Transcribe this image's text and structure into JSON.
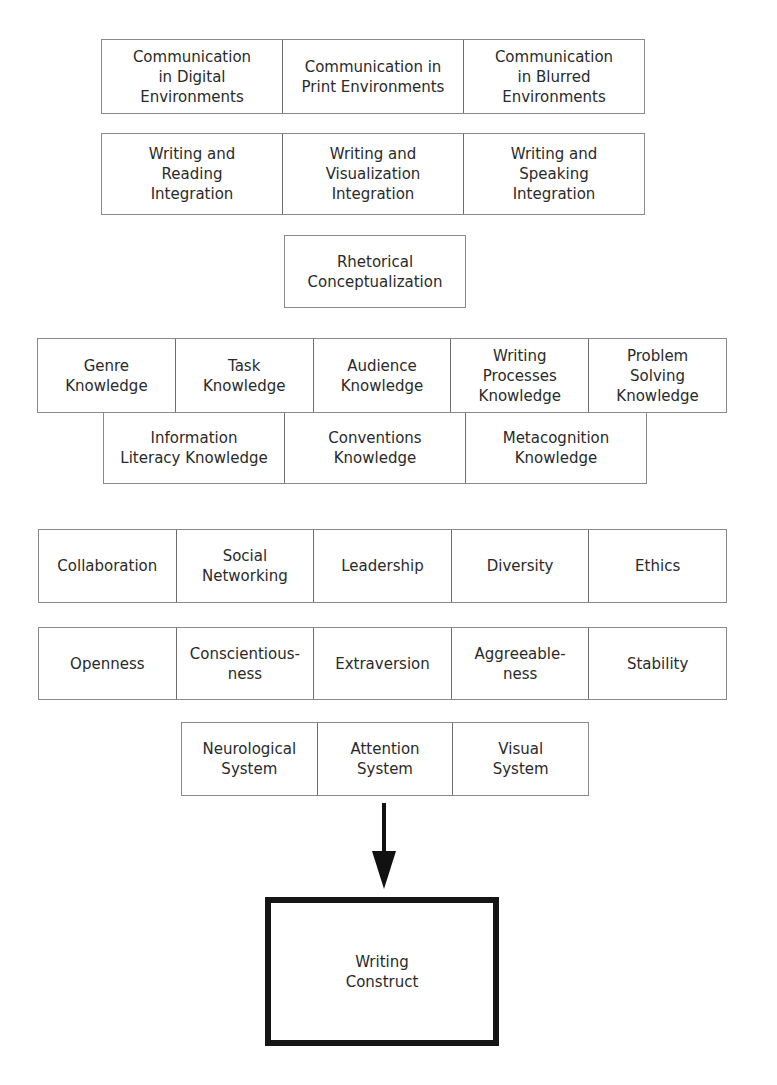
{
  "communication_environments": [
    "Communication\nin Digital\nEnvironments",
    "Communication in\nPrint Environments",
    "Communication\nin Blurred\nEnvironments"
  ],
  "integrations": [
    "Writing and\nReading\nIntegration",
    "Writing and\nVisualization\nIntegration",
    "Writing and\nSpeaking\nIntegration"
  ],
  "rhetorical": "Rhetorical\nConceptualization",
  "knowledge_row_1": [
    "Genre\nKnowledge",
    "Task\nKnowledge",
    "Audience\nKnowledge",
    "Writing\nProcesses\nKnowledge",
    "Problem\nSolving\nKnowledge"
  ],
  "knowledge_row_2": [
    "Information\nLiteracy Knowledge",
    "Conventions\nKnowledge",
    "Metacognition\nKnowledge"
  ],
  "interpersonal": [
    "Collaboration",
    "Social\nNetworking",
    "Leadership",
    "Diversity",
    "Ethics"
  ],
  "personality": [
    "Openness",
    "Conscientious-\nness",
    "Extraversion",
    "Aggreeable-\nness",
    "Stability"
  ],
  "systems": [
    "Neurological\nSystem",
    "Attention\nSystem",
    "Visual\nSystem"
  ],
  "arrow": "down-arrow",
  "result": "Writing\nConstruct"
}
